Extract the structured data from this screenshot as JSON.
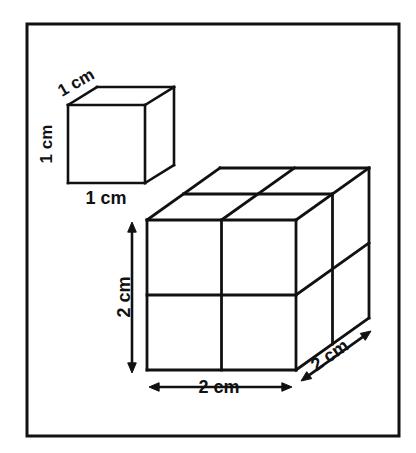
{
  "figure": {
    "title": "Unit cube and 2 cm cube volume comparison diagram",
    "background_color": "#ffffff",
    "stroke_color": "#111111",
    "frame": {
      "name": "figure-border",
      "x": 27,
      "y": 24,
      "width": 372,
      "height": 412,
      "stroke_width": 3
    },
    "shapes": [
      {
        "id": "small-cube",
        "name": "unit-cube",
        "label": "1 cm cube",
        "edge_units": 1,
        "front": {
          "x": 68,
          "y": 105,
          "w": 77,
          "h": 78
        },
        "depth": {
          "dx": 29,
          "dy": -18
        },
        "divisions": 1,
        "stroke_width": 2.6
      },
      {
        "id": "large-cube",
        "name": "two-cm-cube",
        "label": "2 cm cube",
        "edge_units": 2,
        "front": {
          "x": 147,
          "y": 220,
          "w": 149,
          "h": 150
        },
        "depth": {
          "dx": 73,
          "dy": -52
        },
        "divisions": 2,
        "stroke_width": 2.8
      }
    ],
    "labels": [
      {
        "id": "small-top-label",
        "name": "small-cube-depth-label",
        "text": "1 cm",
        "value": 1,
        "unit": "cm",
        "dimension": "depth",
        "x": 62,
        "y": 97,
        "rotation": -30,
        "font_size": 17,
        "anchor": "start"
      },
      {
        "id": "small-left-label",
        "name": "small-cube-height-label",
        "text": "1 cm",
        "value": 1,
        "unit": "cm",
        "dimension": "height",
        "x": 52,
        "y": 144,
        "rotation": -90,
        "font_size": 17,
        "anchor": "middle"
      },
      {
        "id": "small-bottom-label",
        "name": "small-cube-width-label",
        "text": "1 cm",
        "value": 1,
        "unit": "cm",
        "dimension": "width",
        "x": 106,
        "y": 204,
        "rotation": 0,
        "font_size": 18,
        "anchor": "middle"
      },
      {
        "id": "large-left-label",
        "name": "large-cube-height-label",
        "text": "2 cm",
        "value": 2,
        "unit": "cm",
        "dimension": "height",
        "x": 130,
        "y": 297,
        "rotation": -90,
        "font_size": 18,
        "anchor": "middle"
      },
      {
        "id": "large-bottom-label",
        "name": "large-cube-width-label",
        "text": "2 cm",
        "value": 2,
        "unit": "cm",
        "dimension": "width",
        "x": 219,
        "y": 393,
        "rotation": 0,
        "font_size": 18,
        "anchor": "middle"
      },
      {
        "id": "large-depth-label",
        "name": "large-cube-depth-label",
        "text": "2 cm",
        "value": 2,
        "unit": "cm",
        "dimension": "depth",
        "x": 333,
        "y": 360,
        "rotation": -35,
        "font_size": 18,
        "anchor": "middle"
      }
    ],
    "dimension_arrows": [
      {
        "id": "arrow-height",
        "name": "height-dimension-arrow",
        "orientation": "vertical",
        "x1": 132,
        "y1": 222,
        "x2": 132,
        "y2": 373,
        "double_headed": true
      },
      {
        "id": "arrow-width",
        "name": "width-dimension-arrow",
        "orientation": "horizontal",
        "x1": 149,
        "y1": 387,
        "x2": 292,
        "y2": 387,
        "double_headed": true
      },
      {
        "id": "arrow-depth",
        "name": "depth-dimension-arrow",
        "orientation": "diagonal",
        "x1": 301,
        "y1": 381,
        "x2": 371,
        "y2": 331,
        "double_headed": true
      }
    ]
  }
}
